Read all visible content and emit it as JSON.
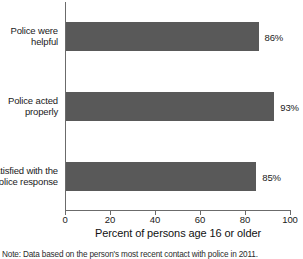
{
  "chart_data": {
    "type": "bar",
    "orientation": "horizontal",
    "title": "",
    "categories": [
      "Police were\nhelpful",
      "Police acted\nproperly",
      "Satisfied with the\npolice response"
    ],
    "category_lines": [
      [
        "Police were",
        "helpful"
      ],
      [
        "Police acted",
        "properly"
      ],
      [
        "Satisfied with the",
        "police response"
      ]
    ],
    "values": [
      86,
      93,
      85
    ],
    "data_labels": [
      "86%",
      "93%",
      "85%"
    ],
    "xlabel": "Percent of persons age 16 or older",
    "ylabel": "",
    "xlim": [
      0,
      100
    ],
    "xticks": [
      0,
      20,
      40,
      60,
      80,
      100
    ],
    "xtick_labels": [
      "0",
      "20",
      "40",
      "60",
      "80",
      "100"
    ],
    "grid": false,
    "legend": "none",
    "bar_color": "#595959",
    "axis_color": "#6b6b6b"
  },
  "footnote": {
    "text": "Note: Data based on the person's most recent contact with police in 2011."
  }
}
